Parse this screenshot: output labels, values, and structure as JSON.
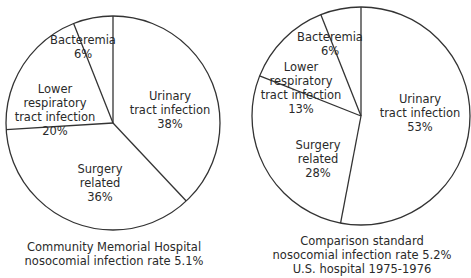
{
  "chart_data": [
    {
      "type": "pie",
      "title": "Community Memorial Hospital nosocomial infection rate 5.1%",
      "caption_lines": [
        "Community Memorial Hospital",
        "nosocomial infection rate 5.1%"
      ],
      "categories": [
        "Urinary tract infection",
        "Surgery related",
        "Lower respiratory tract infection",
        "Bacteremia"
      ],
      "values": [
        38,
        36,
        20,
        6
      ],
      "value_labels": [
        "38%",
        "36%",
        "20%",
        "6%"
      ],
      "start_angle": "12 o'clock",
      "direction": "clockwise",
      "legend": "none (labels inside slices)"
    },
    {
      "type": "pie",
      "title": "Comparison standard nosocomial infection rate 5.2% U.S. hospital 1975-1976",
      "caption_lines": [
        "Comparison standard",
        "nosocomial infection rate 5.2%",
        "U.S. hospital 1975-1976"
      ],
      "categories": [
        "Urinary tract infection",
        "Surgery related",
        "Lower respiratory tract infection",
        "Bacteremia"
      ],
      "values": [
        53,
        28,
        13,
        6
      ],
      "value_labels": [
        "53%",
        "28%",
        "13%",
        "6%"
      ],
      "start_angle": "12 o'clock",
      "direction": "clockwise",
      "legend": "none (labels inside slices)"
    }
  ],
  "charts": [
    {
      "slices": [
        {
          "lines": [
            "Urinary",
            "tract infection",
            "38%"
          ]
        },
        {
          "lines": [
            "Surgery",
            "related",
            "36%"
          ]
        },
        {
          "lines": [
            "Lower",
            "respiratory",
            "tract  infection",
            "20%"
          ]
        },
        {
          "lines": [
            "Bacteremia",
            "6%"
          ]
        }
      ],
      "caption": [
        "Community Memorial Hospital",
        "nosocomial infection rate 5.1%"
      ]
    },
    {
      "slices": [
        {
          "lines": [
            "Urinary",
            "tract infection",
            "53%"
          ]
        },
        {
          "lines": [
            "Surgery",
            "related",
            "28%"
          ]
        },
        {
          "lines": [
            "Lower",
            "respiratory",
            "tract  infection",
            "13%"
          ]
        },
        {
          "lines": [
            "Bacteremia",
            "6%"
          ]
        }
      ],
      "caption": [
        "Comparison standard",
        "nosocomial infection rate 5.2%",
        "U.S. hospital 1975-1976"
      ]
    }
  ],
  "style": {
    "stroke_color": "#333333",
    "fill_color": "#ffffff",
    "text_color": "#2a2a2a"
  }
}
